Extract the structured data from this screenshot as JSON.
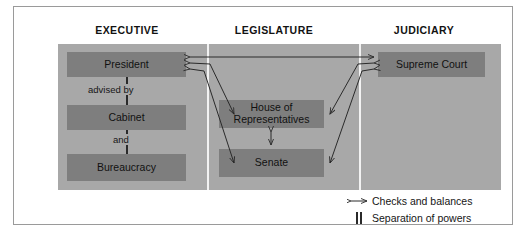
{
  "diagram": {
    "headers": [
      {
        "id": "executive",
        "label": "EXECUTIVE"
      },
      {
        "id": "legislature",
        "label": "LEGISLATURE"
      },
      {
        "id": "judiciary",
        "label": "JUDICIARY"
      }
    ],
    "nodes": {
      "president": "President",
      "cabinet": "Cabinet",
      "bureaucracy": "Bureaucracy",
      "house": "House of\nRepresentatives",
      "house_line1": "House of",
      "house_line2": "Representatives",
      "senate": "Senate",
      "supreme_court": "Supreme Court"
    },
    "connector_labels": {
      "advised_by": "advised by",
      "and": "and"
    },
    "legend": [
      {
        "symbol": "double-headed-arrow",
        "label": "Checks and balances"
      },
      {
        "symbol": "double-vertical-bar",
        "label": "Separation of powers"
      }
    ],
    "colors": {
      "panel": "#a8a8a8",
      "node": "#7e7e7e",
      "separator": "#f2f2f2",
      "arrow": "#2a2a2a",
      "frame": "#9a9a9a",
      "text": "#1b1b1b"
    }
  }
}
